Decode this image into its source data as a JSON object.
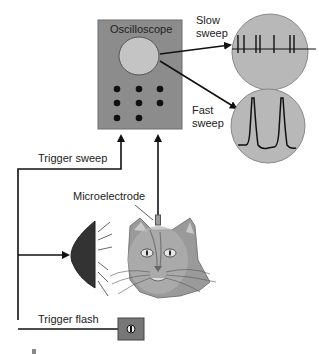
{
  "diagram": {
    "oscilloscope": {
      "label": "Oscilloscope",
      "body_color": "#8c8c8c",
      "screen_color": "#c4c4c4"
    },
    "displays": {
      "slow_sweep": {
        "label_line1": "Slow",
        "label_line2": "sweep"
      },
      "fast_sweep": {
        "label_line1": "Fast",
        "label_line2": "sweep"
      }
    },
    "labels": {
      "trigger_sweep": "Trigger sweep",
      "microelectrode": "Microelectrode",
      "trigger_flash": "Trigger flash"
    },
    "flash_button": {
      "glyph": "ⓘ"
    }
  }
}
